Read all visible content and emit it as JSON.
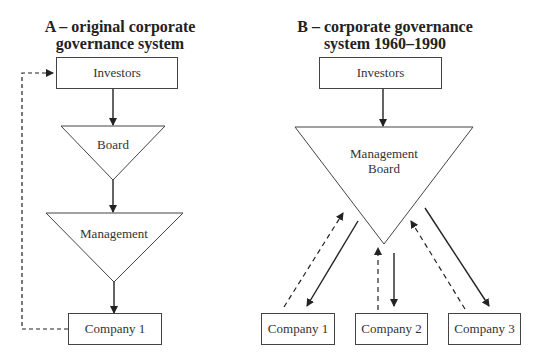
{
  "panel_a": {
    "title_line1": "A – original corporate",
    "title_line2": "governance system",
    "investors": "Investors",
    "board": "Board",
    "management": "Management",
    "company1": "Company 1"
  },
  "panel_b": {
    "title_line1": "B – corporate governance",
    "title_line2": "system 1960–1990",
    "investors": "Investors",
    "management_board_line1": "Management",
    "management_board_line2": "Board",
    "company1": "Company 1",
    "company2": "Company 2",
    "company3": "Company 3"
  },
  "legend": {
    "solid_arrow": "control / direction",
    "dashed_arrow": "feedback / returns"
  }
}
